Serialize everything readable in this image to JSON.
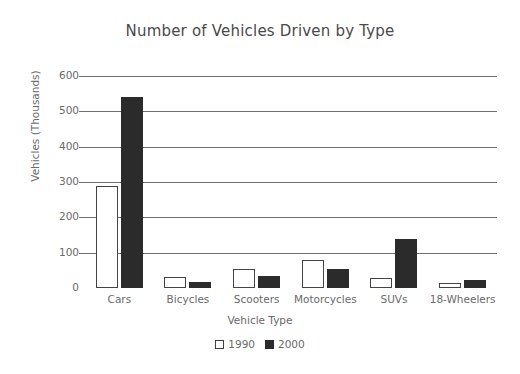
{
  "chart_data": {
    "type": "bar",
    "title": "Number of Vehicles Driven by Type",
    "xlabel": "Vehicle Type",
    "ylabel": "Vehicles (Thousands)",
    "categories": [
      "Cars",
      "Bicycles",
      "Scooters",
      "Motorcycles",
      "SUVs",
      "18-Wheelers"
    ],
    "series": [
      {
        "name": "1990",
        "values": [
          290,
          30,
          55,
          80,
          27,
          15
        ],
        "color": "#ffffff"
      },
      {
        "name": "2000",
        "values": [
          540,
          18,
          35,
          55,
          138,
          22
        ],
        "color": "#2b2b2b"
      }
    ],
    "ylim": [
      0,
      600
    ],
    "yticks": [
      0,
      100,
      200,
      300,
      400,
      500,
      600
    ],
    "ytick_labels": [
      "0",
      "100",
      "200",
      "300",
      "400",
      "500",
      "600"
    ],
    "grid": true,
    "legend_position": "bottom"
  },
  "legend": {
    "entries": [
      {
        "label": "1990",
        "swatch": "open-square"
      },
      {
        "label": "2000",
        "swatch": "filled-square"
      }
    ]
  },
  "colors": {
    "background": "#ffffff",
    "gridline": "#6f6f6f",
    "text": "#6a6a6a",
    "title_text": "#4a4a4a",
    "bar_1990_fill": "#ffffff",
    "bar_1990_stroke": "#444444",
    "bar_2000_fill": "#2b2b2b"
  }
}
